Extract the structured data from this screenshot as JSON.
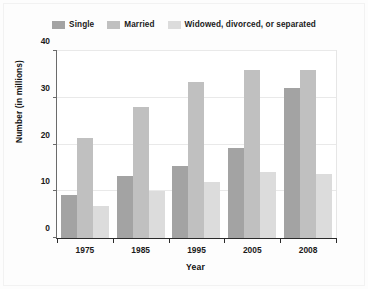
{
  "chart_data": {
    "type": "bar",
    "title": "",
    "xlabel": "Year",
    "ylabel": "Number (in millions)",
    "categories": [
      "1975",
      "1985",
      "1995",
      "2005",
      "2008"
    ],
    "series": [
      {
        "name": "Single",
        "color": "#a3a3a3",
        "values": [
          9.1,
          13.2,
          15.5,
          19.3,
          32.1
        ]
      },
      {
        "name": "Married",
        "color": "#c0c0c0",
        "values": [
          21.5,
          28.0,
          33.3,
          36.0,
          36.0
        ]
      },
      {
        "name": "Widowed, divorced, or separated",
        "color": "#dcdcdc",
        "values": [
          6.8,
          10.0,
          11.9,
          14.2,
          13.6
        ]
      }
    ],
    "ylim": [
      0,
      40
    ],
    "yticks": [
      "0",
      "10",
      "20",
      "30",
      "40"
    ],
    "ytick_values": [
      0,
      10,
      20,
      30,
      40
    ],
    "grid": true,
    "legend_position": "top"
  },
  "colors": {
    "single": "#a3a3a3",
    "married": "#c0c0c0",
    "widowed": "#dcdcdc",
    "axis": "#2b2b2b",
    "grid": "#e9e9e9",
    "text": "#111111",
    "background": "#fdfdfd"
  }
}
